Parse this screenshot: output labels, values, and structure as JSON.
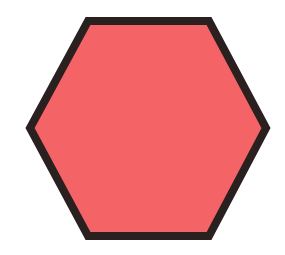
{
  "figure": {
    "shape": "hexagon",
    "orientation": "flat-top",
    "fill_color": "#F46366",
    "stroke_color": "#2A2020",
    "stroke_width": 8,
    "background_color": "#FFFFFF",
    "vertices": [
      [
        88,
        21
      ],
      [
        209,
        21
      ],
      [
        266,
        128
      ],
      [
        209,
        236
      ],
      [
        88,
        236
      ],
      [
        30,
        128
      ]
    ]
  }
}
